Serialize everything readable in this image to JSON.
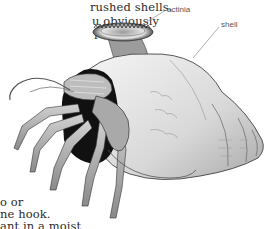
{
  "body_text": {
    "top_lines": [
      "rushed shells.",
      "u obviously",
      "l  with  a"
    ],
    "bottom_lines": [
      "o  or",
      "ne  hook.",
      "ant  in  a  moist"
    ]
  },
  "illustration": {
    "subject": "hermit crab in shell with sea anemone",
    "labels": {
      "actinia": "actinia",
      "shell": "shell"
    }
  }
}
